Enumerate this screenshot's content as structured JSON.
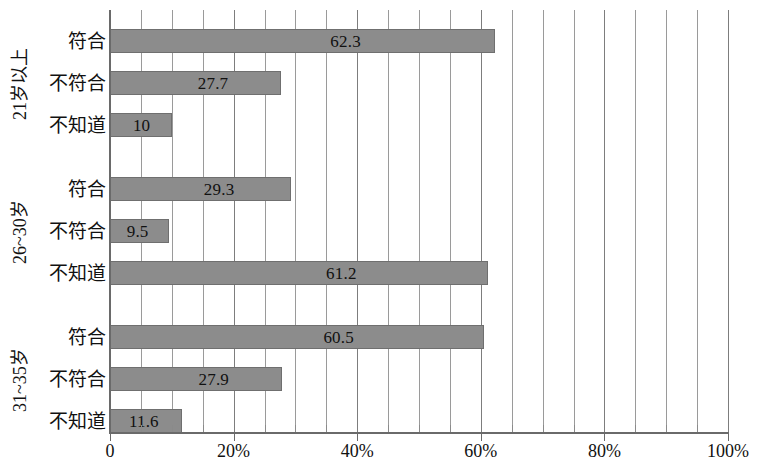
{
  "chart_data": {
    "type": "bar",
    "orientation": "horizontal",
    "title": "",
    "subtitle": "",
    "xlabel": "",
    "ylabel": "",
    "xlim": [
      0,
      100
    ],
    "xticks": [
      0,
      20,
      40,
      60,
      80,
      100
    ],
    "xtick_labels": [
      "0",
      "20%",
      "40%",
      "60%",
      "80%",
      "100%"
    ],
    "minor_tick_step": 5,
    "grid": true,
    "grid_axis": "x",
    "legend": null,
    "bar_color": "#8c8c8c",
    "bar_edge_color": "#6f6f6f",
    "categories": [
      "符合",
      "不符合",
      "不知道"
    ],
    "groups": [
      {
        "name": "21岁以上",
        "items": [
          {
            "label": "符合",
            "value": 62.3,
            "value_text": "62.3"
          },
          {
            "label": "不符合",
            "value": 27.7,
            "value_text": "27.7"
          },
          {
            "label": "不知道",
            "value": 10,
            "value_text": "10"
          }
        ]
      },
      {
        "name": "26~30岁",
        "items": [
          {
            "label": "符合",
            "value": 29.3,
            "value_text": "29.3"
          },
          {
            "label": "不符合",
            "value": 9.5,
            "value_text": "9.5"
          },
          {
            "label": "不知道",
            "value": 61.2,
            "value_text": "61.2"
          }
        ]
      },
      {
        "name": "31~35岁",
        "items": [
          {
            "label": "符合",
            "value": 60.5,
            "value_text": "60.5"
          },
          {
            "label": "不符合",
            "value": 27.9,
            "value_text": "27.9"
          },
          {
            "label": "不知道",
            "value": 11.6,
            "value_text": "11.6"
          }
        ]
      }
    ]
  }
}
